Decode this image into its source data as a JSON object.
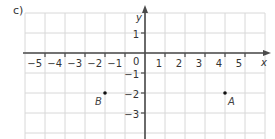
{
  "figure_label": "c)",
  "chart_data": {
    "type": "scatter",
    "title": "",
    "xlabel": "x",
    "ylabel": "y",
    "xlim": [
      -6,
      6
    ],
    "ylim": [
      -4,
      2
    ],
    "grid": true,
    "x_ticks": [
      -5,
      -4,
      -3,
      -2,
      -1,
      1,
      2,
      3,
      4,
      5
    ],
    "x_tick_labels": [
      "−5",
      "−4",
      "−3",
      "−2",
      "−1",
      "1",
      "2",
      "3",
      "4",
      "5"
    ],
    "y_ticks": [
      1,
      -1,
      -2,
      -3
    ],
    "y_tick_labels": [
      "1",
      "−1",
      "−2",
      "−3"
    ],
    "origin_label": "0",
    "points": [
      {
        "name": "B",
        "x": -2,
        "y": -2
      },
      {
        "name": "A",
        "x": 4,
        "y": -2
      }
    ]
  }
}
